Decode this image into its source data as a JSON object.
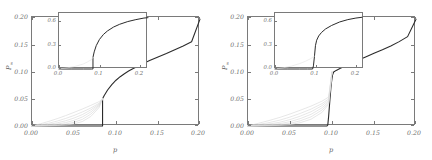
{
  "figure": {
    "panels": [
      {
        "id": "panel-a",
        "axis": {
          "xlabel": "p",
          "ylabel_main": "P",
          "ylabel_sub": "∞",
          "xticks": [
            "0.00",
            "0.05",
            "0.10",
            "0.15",
            "0.20"
          ],
          "xtick_values": [
            0.0,
            0.05,
            0.1,
            0.15,
            0.2
          ],
          "yticks": [
            "0.00",
            "0.05",
            "0.10",
            "0.15",
            "0.20"
          ],
          "ytick_values": [
            0.0,
            0.05,
            0.1,
            0.15,
            0.2
          ],
          "xlim": [
            0.0,
            0.2
          ],
          "ylim": [
            0.0,
            0.2
          ]
        },
        "inset": {
          "xticks": [
            "0.0",
            "0.1",
            "0.2"
          ],
          "xtick_values": [
            0.0,
            0.1,
            0.2
          ],
          "yticks": [
            "0.0",
            "0.3",
            "0.6"
          ],
          "ytick_values": [
            0.0,
            0.3,
            0.6
          ],
          "xlim": [
            0.0,
            0.22
          ],
          "ylim": [
            0.0,
            0.72
          ]
        }
      },
      {
        "id": "panel-b",
        "axis": {
          "xlabel": "p",
          "ylabel_main": "P",
          "ylabel_sub": "∞",
          "xticks": [
            "0.00",
            "0.05",
            "0.10",
            "0.15",
            "0.20"
          ],
          "xtick_values": [
            0.0,
            0.05,
            0.1,
            0.15,
            0.2
          ],
          "yticks": [
            "0.00",
            "0.05",
            "0.10",
            "0.15",
            "0.20"
          ],
          "ytick_values": [
            0.0,
            0.05,
            0.1,
            0.15,
            0.2
          ],
          "xlim": [
            0.0,
            0.2
          ],
          "ylim": [
            0.0,
            0.2
          ]
        },
        "inset": {
          "xticks": [
            "0.0",
            "0.1",
            "0.2"
          ],
          "xtick_values": [
            0.0,
            0.1,
            0.2
          ],
          "yticks": [
            "0.0",
            "0.3",
            "0.6"
          ],
          "ytick_values": [
            0.0,
            0.3,
            0.6
          ],
          "xlim": [
            0.0,
            0.22
          ],
          "ylim": [
            0.0,
            0.72
          ]
        }
      }
    ],
    "colors": {
      "main_curve": "#2b2b2b",
      "finite_size_curves": "#d8d8d8",
      "axis": "#7a7a7a",
      "tick_label": "#6f6f6f",
      "background": "#ffffff"
    }
  },
  "chart_data": [
    {
      "type": "line",
      "panel": "panel-a",
      "title": "",
      "subtitle": "",
      "xlabel": "p",
      "ylabel": "P∞",
      "xlim": [
        0.0,
        0.2
      ],
      "ylim": [
        0.0,
        0.2
      ],
      "xticks": [
        0.0,
        0.05,
        0.1,
        0.15,
        0.2
      ],
      "yticks": [
        0.0,
        0.05,
        0.1,
        0.15,
        0.2
      ],
      "grid": false,
      "legend": "none",
      "annotations": [
        "discontinuous jump at p = 0.084 from P∞ = 0.000 to P∞ = 0.050"
      ],
      "series": [
        {
          "name": "thermodynamic-limit",
          "color": "#2b2b2b",
          "width": 1.1,
          "x": [
            0.0,
            0.02,
            0.04,
            0.06,
            0.07,
            0.08,
            0.0835,
            0.084,
            0.084,
            0.086,
            0.09,
            0.095,
            0.1,
            0.105,
            0.11,
            0.115,
            0.12,
            0.13,
            0.14,
            0.15,
            0.16,
            0.17,
            0.18,
            0.19,
            0.2
          ],
          "y": [
            0.0,
            0.0,
            0.0,
            0.0,
            0.0,
            0.0,
            0.0,
            0.0,
            0.05,
            0.056,
            0.066,
            0.076,
            0.084,
            0.0905,
            0.096,
            0.1008,
            0.1052,
            0.113,
            0.12,
            0.1268,
            0.1332,
            0.14,
            0.147,
            0.1545,
            0.196
          ]
        },
        {
          "name": "finite-size-N1",
          "color": "#dcdcdc",
          "width": 0.7,
          "x": [
            0.0,
            0.01,
            0.02,
            0.03,
            0.04,
            0.05,
            0.06,
            0.07,
            0.08,
            0.084
          ],
          "y": [
            0.0,
            0.004,
            0.0085,
            0.0135,
            0.019,
            0.025,
            0.0312,
            0.0378,
            0.0448,
            0.05
          ]
        },
        {
          "name": "finite-size-N2",
          "color": "#dcdcdc",
          "width": 0.7,
          "x": [
            0.0,
            0.01,
            0.02,
            0.03,
            0.04,
            0.05,
            0.06,
            0.07,
            0.08,
            0.084
          ],
          "y": [
            0.0,
            0.0022,
            0.0052,
            0.009,
            0.0138,
            0.0193,
            0.0258,
            0.033,
            0.0418,
            0.05
          ]
        },
        {
          "name": "finite-size-N3",
          "color": "#dcdcdc",
          "width": 0.7,
          "x": [
            0.0,
            0.01,
            0.02,
            0.03,
            0.04,
            0.05,
            0.06,
            0.07,
            0.08,
            0.084
          ],
          "y": [
            0.0,
            0.0012,
            0.003,
            0.0058,
            0.0096,
            0.0146,
            0.021,
            0.0295,
            0.04,
            0.05
          ]
        },
        {
          "name": "finite-size-N4",
          "color": "#dcdcdc",
          "width": 0.7,
          "x": [
            0.0,
            0.01,
            0.02,
            0.03,
            0.04,
            0.05,
            0.06,
            0.07,
            0.08,
            0.084
          ],
          "y": [
            0.0,
            0.0006,
            0.0016,
            0.0034,
            0.0062,
            0.0104,
            0.0166,
            0.0258,
            0.0382,
            0.05
          ]
        },
        {
          "name": "finite-size-N5",
          "color": "#dcdcdc",
          "width": 0.7,
          "x": [
            0.0,
            0.01,
            0.02,
            0.03,
            0.04,
            0.05,
            0.06,
            0.07,
            0.08,
            0.084
          ],
          "y": [
            0.0,
            0.0003,
            0.0008,
            0.0018,
            0.0036,
            0.0068,
            0.0122,
            0.0218,
            0.0362,
            0.05
          ]
        },
        {
          "name": "finite-size-N6",
          "color": "#dcdcdc",
          "width": 0.7,
          "x": [
            0.0,
            0.01,
            0.02,
            0.03,
            0.04,
            0.05,
            0.06,
            0.07,
            0.08,
            0.084
          ],
          "y": [
            0.0,
            0.0001,
            0.0004,
            0.0009,
            0.0019,
            0.004,
            0.0082,
            0.0175,
            0.034,
            0.05
          ]
        }
      ]
    },
    {
      "type": "line",
      "panel": "panel-a-inset",
      "title": "",
      "xlabel": "",
      "ylabel": "",
      "xlim": [
        0.0,
        0.22
      ],
      "ylim": [
        0.0,
        0.72
      ],
      "xticks": [
        0.0,
        0.1,
        0.2
      ],
      "yticks": [
        0.0,
        0.3,
        0.6
      ],
      "grid": false,
      "legend": "none",
      "annotations": [
        "same transition shown on full order-parameter range"
      ],
      "series": [
        {
          "name": "thermodynamic-limit",
          "color": "#2b2b2b",
          "width": 1.0,
          "x": [
            0.0,
            0.03,
            0.06,
            0.08,
            0.0835,
            0.084,
            0.084,
            0.087,
            0.092,
            0.1,
            0.11,
            0.12,
            0.135,
            0.15,
            0.17,
            0.19,
            0.21,
            0.22
          ],
          "y": [
            0.0,
            0.0,
            0.0,
            0.0,
            0.0,
            0.0,
            0.15,
            0.22,
            0.3,
            0.38,
            0.445,
            0.49,
            0.54,
            0.575,
            0.61,
            0.635,
            0.655,
            0.66
          ]
        },
        {
          "name": "finite-size-family",
          "color": "#e2e2e2",
          "width": 0.6,
          "x": [
            0.0,
            0.02,
            0.04,
            0.06,
            0.07,
            0.08,
            0.084
          ],
          "y": [
            0.0,
            0.014,
            0.034,
            0.064,
            0.09,
            0.12,
            0.15
          ]
        }
      ]
    },
    {
      "type": "line",
      "panel": "panel-b",
      "title": "",
      "subtitle": "",
      "xlabel": "p",
      "ylabel": "P∞",
      "xlim": [
        0.0,
        0.2
      ],
      "ylim": [
        0.0,
        0.2
      ],
      "xticks": [
        0.0,
        0.05,
        0.1,
        0.15,
        0.2
      ],
      "yticks": [
        0.0,
        0.05,
        0.1,
        0.15,
        0.2
      ],
      "grid": false,
      "legend": "none",
      "annotations": [
        "steep rise near p = 0.095 reaching a kink at P∞ = 0.100"
      ],
      "series": [
        {
          "name": "thermodynamic-limit",
          "color": "#2b2b2b",
          "width": 1.1,
          "x": [
            0.0,
            0.02,
            0.04,
            0.06,
            0.08,
            0.09,
            0.094,
            0.095,
            0.096,
            0.0975,
            0.099,
            0.1005,
            0.102,
            0.105,
            0.11,
            0.115,
            0.12,
            0.13,
            0.14,
            0.15,
            0.16,
            0.17,
            0.18,
            0.19,
            0.2
          ],
          "y": [
            0.0,
            0.0,
            0.0,
            0.0,
            0.0,
            0.0,
            0.0,
            0.002,
            0.018,
            0.048,
            0.076,
            0.093,
            0.099,
            0.102,
            0.106,
            0.1095,
            0.113,
            0.12,
            0.1268,
            0.1335,
            0.14,
            0.147,
            0.1548,
            0.164,
            0.196
          ]
        },
        {
          "name": "finite-size-N1",
          "color": "#dcdcdc",
          "width": 0.7,
          "x": [
            0.0,
            0.012,
            0.025,
            0.038,
            0.05,
            0.062,
            0.075,
            0.088,
            0.096,
            0.1
          ],
          "y": [
            0.0,
            0.0048,
            0.01,
            0.0158,
            0.022,
            0.0288,
            0.0365,
            0.0455,
            0.053,
            0.099
          ]
        },
        {
          "name": "finite-size-N2",
          "color": "#dcdcdc",
          "width": 0.7,
          "x": [
            0.0,
            0.012,
            0.025,
            0.038,
            0.05,
            0.062,
            0.075,
            0.088,
            0.096,
            0.1
          ],
          "y": [
            0.0,
            0.0026,
            0.0062,
            0.0108,
            0.0164,
            0.023,
            0.031,
            0.041,
            0.0496,
            0.099
          ]
        },
        {
          "name": "finite-size-N3",
          "color": "#dcdcdc",
          "width": 0.7,
          "x": [
            0.0,
            0.012,
            0.025,
            0.038,
            0.05,
            0.062,
            0.075,
            0.088,
            0.096,
            0.1
          ],
          "y": [
            0.0,
            0.0014,
            0.0036,
            0.007,
            0.0118,
            0.018,
            0.0262,
            0.0372,
            0.047,
            0.099
          ]
        },
        {
          "name": "finite-size-N4",
          "color": "#dcdcdc",
          "width": 0.7,
          "x": [
            0.0,
            0.012,
            0.025,
            0.038,
            0.05,
            0.062,
            0.075,
            0.088,
            0.096,
            0.1
          ],
          "y": [
            0.0,
            0.0007,
            0.002,
            0.0043,
            0.008,
            0.0134,
            0.0214,
            0.0332,
            0.0444,
            0.099
          ]
        },
        {
          "name": "finite-size-N5",
          "color": "#dcdcdc",
          "width": 0.7,
          "x": [
            0.0,
            0.012,
            0.025,
            0.038,
            0.05,
            0.062,
            0.075,
            0.088,
            0.096,
            0.1
          ],
          "y": [
            0.0,
            0.0003,
            0.001,
            0.0024,
            0.005,
            0.0094,
            0.0168,
            0.0292,
            0.042,
            0.099
          ]
        },
        {
          "name": "finite-size-N6",
          "color": "#dcdcdc",
          "width": 0.7,
          "x": [
            0.0,
            0.012,
            0.025,
            0.038,
            0.05,
            0.062,
            0.075,
            0.088,
            0.096,
            0.1
          ],
          "y": [
            0.0,
            0.0001,
            0.0005,
            0.0012,
            0.0028,
            0.006,
            0.0124,
            0.0248,
            0.0396,
            0.099
          ]
        }
      ]
    },
    {
      "type": "line",
      "panel": "panel-b-inset",
      "title": "",
      "xlabel": "",
      "ylabel": "",
      "xlim": [
        0.0,
        0.22
      ],
      "ylim": [
        0.0,
        0.72
      ],
      "xticks": [
        0.0,
        0.1,
        0.2
      ],
      "yticks": [
        0.0,
        0.3,
        0.6
      ],
      "grid": false,
      "legend": "none",
      "annotations": [
        "sharp near-vertical rise at p ≈ 0.10"
      ],
      "series": [
        {
          "name": "thermodynamic-limit",
          "color": "#2b2b2b",
          "width": 1.0,
          "x": [
            0.0,
            0.03,
            0.06,
            0.08,
            0.093,
            0.095,
            0.0975,
            0.1,
            0.103,
            0.108,
            0.115,
            0.125,
            0.14,
            0.16,
            0.18,
            0.2,
            0.215
          ],
          "y": [
            0.0,
            0.0,
            0.0,
            0.0,
            0.0,
            0.04,
            0.16,
            0.3,
            0.37,
            0.425,
            0.47,
            0.515,
            0.56,
            0.605,
            0.635,
            0.655,
            0.665
          ]
        },
        {
          "name": "finite-size-family",
          "color": "#e2e2e2",
          "width": 0.6,
          "x": [
            0.0,
            0.02,
            0.04,
            0.06,
            0.075,
            0.088,
            0.097
          ],
          "y": [
            0.0,
            0.015,
            0.036,
            0.068,
            0.099,
            0.132,
            0.165
          ]
        }
      ]
    }
  ]
}
